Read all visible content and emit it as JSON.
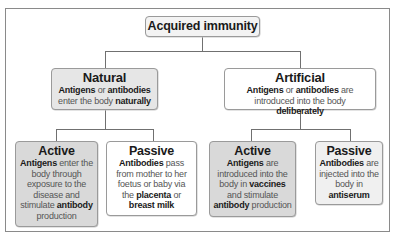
{
  "diagram": {
    "root": {
      "title": "Acquired immunity"
    },
    "natural": {
      "title": "Natural",
      "desc": [
        {
          "text": "Antigens",
          "bold": true
        },
        {
          "text": " or ",
          "bold": false
        },
        {
          "text": "antibodies",
          "bold": true
        },
        {
          "text": " enter the body ",
          "bold": false
        },
        {
          "text": "naturally",
          "bold": true
        }
      ],
      "children": {
        "active": {
          "title": "Active",
          "desc": [
            {
              "text": "Antigens",
              "bold": true
            },
            {
              "text": " enter the body through exposure to the disease and stimulate ",
              "bold": false
            },
            {
              "text": "antibody",
              "bold": true
            },
            {
              "text": " production",
              "bold": false
            }
          ]
        },
        "passive": {
          "title": "Passive",
          "desc": [
            {
              "text": "Antibodies",
              "bold": true
            },
            {
              "text": " pass from mother to her foetus or baby via the ",
              "bold": false
            },
            {
              "text": "placenta",
              "bold": true
            },
            {
              "text": " or ",
              "bold": false
            },
            {
              "text": "breast milk",
              "bold": true
            }
          ]
        }
      }
    },
    "artificial": {
      "title": "Artificial",
      "desc": [
        {
          "text": "Antigens",
          "bold": true
        },
        {
          "text": " or ",
          "bold": false
        },
        {
          "text": "antibodies",
          "bold": true
        },
        {
          "text": " are introduced into the body ",
          "bold": false
        },
        {
          "text": "deliberately",
          "bold": true
        }
      ],
      "children": {
        "active": {
          "title": "Active",
          "desc": [
            {
              "text": "Antigens",
              "bold": true
            },
            {
              "text": " are introduced into the body in ",
              "bold": false
            },
            {
              "text": "vaccines",
              "bold": true
            },
            {
              "text": " and stimulate ",
              "bold": false
            },
            {
              "text": "antibody",
              "bold": true
            },
            {
              "text": " production",
              "bold": false
            }
          ]
        },
        "passive": {
          "title": "Passive",
          "desc": [
            {
              "text": "Antibodies",
              "bold": true
            },
            {
              "text": " are injected into the body in ",
              "bold": false
            },
            {
              "text": "antiserum",
              "bold": true
            }
          ]
        }
      }
    },
    "colors": {
      "line": "#707070",
      "border": "#9a9a9a",
      "active_fill": "#d9d9d9",
      "natural_fill": "#e6e6e6",
      "white_fill": "#ffffff",
      "light_fill": "#f0f0f0"
    }
  }
}
